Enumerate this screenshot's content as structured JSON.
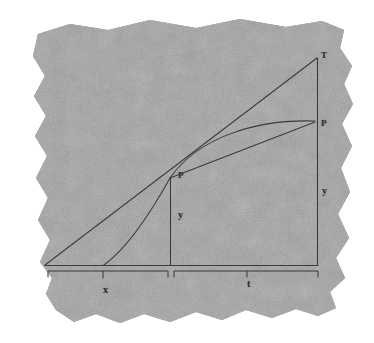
{
  "document": {
    "kind": "scanned-paper-fragment",
    "background_color": "#ffffff",
    "paper_color": "#ababab",
    "ink_color": "#3a3a3a",
    "caption": ""
  },
  "figure": {
    "title": "",
    "labels": [
      {
        "id": "tangent-top",
        "text": "T",
        "x": 321,
        "y": 51,
        "style": "cap"
      },
      {
        "id": "curve-right",
        "text": "P",
        "x": 321,
        "y": 119,
        "style": "cap"
      },
      {
        "id": "point-p",
        "text": "P",
        "x": 178,
        "y": 171,
        "style": "cap"
      },
      {
        "id": "ordinate-y",
        "text": "y",
        "x": 178,
        "y": 210,
        "style": "low"
      },
      {
        "id": "right-y",
        "text": "y",
        "x": 322,
        "y": 186,
        "style": "low"
      },
      {
        "id": "abscissa-x",
        "text": "x",
        "x": 103,
        "y": 285,
        "style": "low"
      },
      {
        "id": "subtangent-t",
        "text": "t",
        "x": 247,
        "y": 279,
        "style": "low"
      }
    ],
    "geometry": {
      "baseline": {
        "x1": 45,
        "y1": 265,
        "x2": 318,
        "y2": 265
      },
      "tangent_line": {
        "x1": 45,
        "y1": 265,
        "x2": 317,
        "y2": 58
      },
      "chord_line": {
        "x1": 170,
        "y1": 178,
        "x2": 315,
        "y2": 122
      },
      "ordinate_line": {
        "x1": 170,
        "y1": 178,
        "x2": 170,
        "y2": 265
      },
      "right_ordinate_line": {
        "x1": 317,
        "y1": 58,
        "x2": 317,
        "y2": 265
      },
      "curve": "M 104 265 C 128 250 152 212 170 178 C 196 140 252 120 315 121",
      "brace_left": {
        "from": 48,
        "to": 168,
        "y": 270,
        "tick_x": 103
      },
      "brace_right": {
        "from": 174,
        "to": 318,
        "y": 270,
        "tick_x": 247
      }
    }
  }
}
